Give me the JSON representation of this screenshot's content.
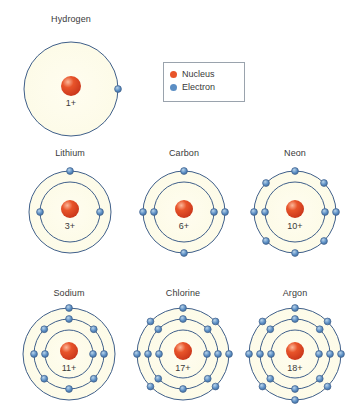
{
  "diagram": {
    "colors": {
      "shell_stroke": "#3f5f8a",
      "shell_fill": "#fdfbe8",
      "nucleus": "#e8542a",
      "nucleus_highlight": "#f5a07a",
      "electron": "#5b8ec4",
      "electron_highlight": "#b9d4ea",
      "electron_stroke": "#3f5f8a",
      "label_text": "#3a3a3a",
      "legend_border": "#9aa3ad",
      "background": "#ffffff"
    }
  },
  "legend": {
    "items": [
      {
        "label": "Nucleus",
        "color": "#e8542a"
      },
      {
        "label": "Electron",
        "color": "#5b8ec4"
      }
    ]
  },
  "atoms": [
    {
      "name": "Hydrogen",
      "charge": "1+",
      "x": 12,
      "y": 14,
      "size": 118,
      "label_y": 0,
      "center_y": 75,
      "nucleus_r": 10,
      "shells": [
        {
          "radius": 47,
          "electrons": [
            "E"
          ]
        }
      ]
    },
    {
      "name": "Lithium",
      "charge": "3+",
      "x": 18,
      "y": 148,
      "size": 104,
      "label_y": 0,
      "center_y": 64,
      "nucleus_r": 9,
      "shells": [
        {
          "radius": 30,
          "electrons": [
            "W",
            "E"
          ]
        },
        {
          "radius": 41,
          "electrons": [
            "N"
          ]
        }
      ]
    },
    {
      "name": "Carbon",
      "charge": "6+",
      "x": 132,
      "y": 148,
      "size": 104,
      "label_y": 0,
      "center_y": 64,
      "nucleus_r": 9,
      "shells": [
        {
          "radius": 30,
          "electrons": [
            "W",
            "E"
          ]
        },
        {
          "radius": 41,
          "electrons": [
            "N",
            "S",
            "W",
            "E"
          ]
        }
      ]
    },
    {
      "name": "Neon",
      "charge": "10+",
      "x": 243,
      "y": 148,
      "size": 104,
      "label_y": 0,
      "center_y": 64,
      "nucleus_r": 9,
      "shells": [
        {
          "radius": 30,
          "electrons": [
            "W",
            "E"
          ]
        },
        {
          "radius": 41,
          "electrons": [
            "N",
            "NE",
            "E",
            "SE",
            "S",
            "SW",
            "W",
            "NW"
          ]
        }
      ]
    },
    {
      "name": "Sodium",
      "charge": "11+",
      "x": 14,
      "y": 288,
      "size": 110,
      "label_y": 0,
      "center_y": 66,
      "nucleus_r": 9,
      "shells": [
        {
          "radius": 24,
          "electrons": [
            "W",
            "E"
          ]
        },
        {
          "radius": 35,
          "electrons": [
            "N",
            "NE",
            "E",
            "SE",
            "S",
            "SW",
            "W",
            "NW"
          ]
        },
        {
          "radius": 46,
          "electrons": [
            "N"
          ]
        }
      ]
    },
    {
      "name": "Chlorine",
      "charge": "17+",
      "x": 128,
      "y": 288,
      "size": 110,
      "label_y": 0,
      "center_y": 66,
      "nucleus_r": 9,
      "shells": [
        {
          "radius": 24,
          "electrons": [
            "W",
            "E"
          ]
        },
        {
          "radius": 35,
          "electrons": [
            "N",
            "NE",
            "E",
            "SE",
            "S",
            "SW",
            "W",
            "NW"
          ]
        },
        {
          "radius": 46,
          "electrons": [
            "N",
            "NE",
            "E",
            "SE",
            "SW",
            "W",
            "NW"
          ]
        }
      ]
    },
    {
      "name": "Argon",
      "charge": "18+",
      "x": 240,
      "y": 288,
      "size": 110,
      "label_y": 0,
      "center_y": 66,
      "nucleus_r": 9,
      "shells": [
        {
          "radius": 24,
          "electrons": [
            "W",
            "E"
          ]
        },
        {
          "radius": 35,
          "electrons": [
            "N",
            "NE",
            "E",
            "SE",
            "S",
            "SW",
            "W",
            "NW"
          ]
        },
        {
          "radius": 46,
          "electrons": [
            "N",
            "NE",
            "E",
            "SE",
            "S",
            "SW",
            "W",
            "NW"
          ]
        }
      ]
    }
  ],
  "legend_box": {
    "x": 163,
    "y": 62,
    "width": 82,
    "height": 40
  }
}
